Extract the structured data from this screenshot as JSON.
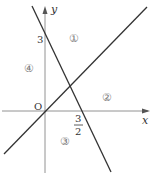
{
  "diagram": {
    "axes": {
      "x_label": "x",
      "y_label": "y",
      "origin_label": "O"
    },
    "intercepts": {
      "y_intercept_label": "3",
      "x_intercept_numerator": "3",
      "x_intercept_denominator": "2"
    },
    "regions": [
      {
        "id": 1,
        "label": "①"
      },
      {
        "id": 2,
        "label": "②"
      },
      {
        "id": 3,
        "label": "③"
      },
      {
        "id": 4,
        "label": "④"
      }
    ],
    "lines": [
      {
        "name": "decreasing-line",
        "equation_hint": "y = -2x + 3",
        "color": "#333333"
      },
      {
        "name": "increasing-line",
        "equation_hint": "through origin",
        "color": "#333333"
      }
    ],
    "colors": {
      "axis": "#777777",
      "line": "#333333"
    }
  }
}
